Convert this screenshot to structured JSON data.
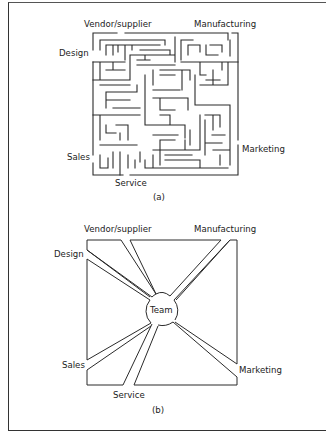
{
  "figure_a": {
    "caption": "(a)",
    "labels": {
      "vendor": "Vendor/supplier",
      "manufacturing": "Manufacturing",
      "design": "Design",
      "sales": "Sales",
      "service": "Service",
      "marketing": "Marketing"
    }
  },
  "figure_b": {
    "caption": "(b)",
    "center": "Team",
    "labels": {
      "vendor": "Vendor/supplier",
      "manufacturing": "Manufacturing",
      "design": "Design",
      "sales": "Sales",
      "service": "Service",
      "marketing": "Marketing"
    }
  }
}
